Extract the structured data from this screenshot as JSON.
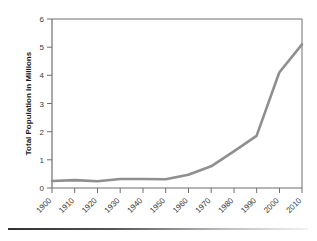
{
  "chart_data": {
    "type": "line",
    "title": "",
    "subtitle": "",
    "xlabel": "",
    "ylabel": "Total Population in Millions",
    "categories": [
      "1900",
      "1910",
      "1920",
      "1930",
      "1940",
      "1950",
      "1960",
      "1970",
      "1980",
      "1990",
      "2000",
      "2010"
    ],
    "x": [
      1900,
      1910,
      1920,
      1930,
      1940,
      1950,
      1960,
      1970,
      1980,
      1990,
      2000,
      2010
    ],
    "values": [
      0.25,
      0.28,
      0.24,
      0.32,
      0.32,
      0.31,
      0.47,
      0.77,
      1.3,
      1.85,
      4.1,
      5.1
    ],
    "series": [
      {
        "name": "Total Population",
        "values": [
          0.25,
          0.28,
          0.24,
          0.32,
          0.32,
          0.31,
          0.47,
          0.77,
          1.3,
          1.85,
          4.1,
          5.1
        ],
        "color": "#8f8f8f"
      }
    ],
    "ylim": [
      0,
      6
    ],
    "yticks": [
      0,
      1,
      2,
      3,
      4,
      5,
      6
    ],
    "ytick_labels": [
      "0",
      "1",
      "2",
      "3",
      "4",
      "5",
      "6"
    ],
    "xlim": [
      1900,
      2010
    ],
    "grid": false,
    "legend": false,
    "legend_position": "none",
    "axis_color": "#6e6e6e",
    "line_color": "#8f8f8f",
    "xtick_label_rotation": "45"
  },
  "figure": {
    "background_color": "#ffffff",
    "bottom_rule": "horizontal-rule"
  }
}
